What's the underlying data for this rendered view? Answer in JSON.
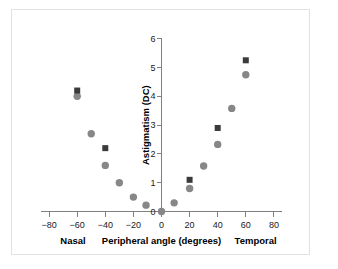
{
  "chart_data": {
    "type": "scatter",
    "title": "",
    "xlabel": "Peripheral angle (degrees)",
    "ylabel": "Astigmatism (DC)",
    "xlim": [
      -85,
      85
    ],
    "ylim": [
      0,
      6
    ],
    "xticks": [
      -80,
      -60,
      -40,
      -20,
      0,
      20,
      40,
      60,
      80
    ],
    "xtick_labels": [
      "−80",
      "−60",
      "−40",
      "−20",
      "0",
      "20",
      "40",
      "60",
      "80"
    ],
    "yticks": [
      0,
      1,
      2,
      3,
      4,
      5,
      6
    ],
    "ytick_labels": [
      "0",
      "1",
      "2",
      "3",
      "4",
      "5",
      "6"
    ],
    "grid": false,
    "legend": "none",
    "region_labels": {
      "left": "Nasal",
      "right": "Temporal"
    },
    "series": [
      {
        "name": "circle-series",
        "marker": "circle",
        "color": "#878787",
        "points": [
          {
            "x": -60,
            "y": 4.0
          },
          {
            "x": -50,
            "y": 2.7
          },
          {
            "x": -40,
            "y": 1.6
          },
          {
            "x": -30,
            "y": 1.0
          },
          {
            "x": -20,
            "y": 0.5
          },
          {
            "x": -11,
            "y": 0.22
          },
          {
            "x": 0,
            "y": 0.0
          },
          {
            "x": 9,
            "y": 0.3
          },
          {
            "x": 20,
            "y": 0.8
          },
          {
            "x": 30,
            "y": 1.58
          },
          {
            "x": 40,
            "y": 2.33
          },
          {
            "x": 50,
            "y": 3.58
          },
          {
            "x": 60,
            "y": 4.75
          }
        ]
      },
      {
        "name": "square-series",
        "marker": "square",
        "color": "#3a3a3a",
        "points": [
          {
            "x": -60,
            "y": 4.2
          },
          {
            "x": -40,
            "y": 2.2
          },
          {
            "x": 20,
            "y": 1.1
          },
          {
            "x": 40,
            "y": 2.9
          },
          {
            "x": 60,
            "y": 5.25
          }
        ]
      }
    ]
  }
}
